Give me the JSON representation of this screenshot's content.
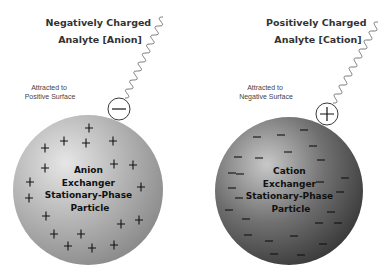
{
  "panels": [
    {
      "id": "anion",
      "analyte_title": [
        "Negatively Charged",
        "Analyte [Anion]"
      ],
      "attracted_note": [
        "Attracted to",
        "Positive Surface"
      ],
      "particle_label": [
        "Anion",
        "Exchanger",
        "Stationary-Phase",
        "Particle"
      ],
      "analyte_charge_symbol": "minus",
      "surface_charge_symbol": "+",
      "sphere": {
        "cx": 88,
        "cy": 190,
        "r": 75,
        "highlight": "#e6e6e6",
        "mid": "#b4b4b4",
        "edge": "#8c8c8c"
      },
      "analyte": {
        "cx": 119,
        "cy": 109,
        "r": 11
      },
      "tail": {
        "x0": 125,
        "y0": 98,
        "x1": 163,
        "y1": 17
      },
      "title_pos": {
        "x": 100,
        "y": 26
      },
      "note_pos": {
        "x": 50,
        "y": 90
      },
      "charges": [
        [
          89,
          128
        ],
        [
          45,
          148
        ],
        [
          64,
          141
        ],
        [
          86,
          143
        ],
        [
          113,
          141
        ],
        [
          45,
          168
        ],
        [
          114,
          164
        ],
        [
          133,
          165
        ],
        [
          30,
          182
        ],
        [
          141,
          187
        ],
        [
          29,
          198
        ],
        [
          46,
          216
        ],
        [
          121,
          224
        ],
        [
          139,
          220
        ],
        [
          54,
          234
        ],
        [
          81,
          234
        ],
        [
          68,
          246
        ],
        [
          92,
          248
        ],
        [
          114,
          245
        ]
      ]
    },
    {
      "id": "cation",
      "analyte_title": [
        "Positively Charged",
        "Analyte [Cation]"
      ],
      "attracted_note": [
        "Attracted to",
        "Negative Surface"
      ],
      "particle_label": [
        "Cation",
        "Exchanger",
        "Stationary-Phase",
        "Particle"
      ],
      "analyte_charge_symbol": "plus",
      "surface_charge_symbol": "−",
      "sphere": {
        "cx": 289,
        "cy": 191,
        "r": 74,
        "highlight": "#c8c8c8",
        "mid": "#707070",
        "edge": "#3c3c3c"
      },
      "analyte": {
        "cx": 327,
        "cy": 114,
        "r": 11
      },
      "tail": {
        "x0": 333,
        "y0": 103,
        "x1": 378,
        "y1": 22
      },
      "title_pos": {
        "x": 318,
        "y": 26
      },
      "note_pos": {
        "x": 266,
        "y": 90
      },
      "charges": [
        [
          257,
          137
        ],
        [
          281,
          135
        ],
        [
          304,
          130
        ],
        [
          238,
          157
        ],
        [
          259,
          158
        ],
        [
          288,
          152
        ],
        [
          313,
          146
        ],
        [
          240,
          174
        ],
        [
          321,
          160
        ],
        [
          232,
          173
        ],
        [
          320,
          182
        ],
        [
          345,
          178
        ],
        [
          232,
          188
        ],
        [
          340,
          192
        ],
        [
          239,
          198
        ],
        [
          331,
          212
        ],
        [
          229,
          210
        ],
        [
          338,
          223
        ],
        [
          246,
          219
        ],
        [
          319,
          223
        ],
        [
          248,
          235
        ],
        [
          269,
          241
        ],
        [
          294,
          236
        ],
        [
          323,
          244
        ],
        [
          274,
          254
        ],
        [
          301,
          255
        ]
      ]
    }
  ],
  "colors": {
    "stroke": "#222222",
    "tail": "#555555",
    "analyte_fill": "#ffffff"
  }
}
